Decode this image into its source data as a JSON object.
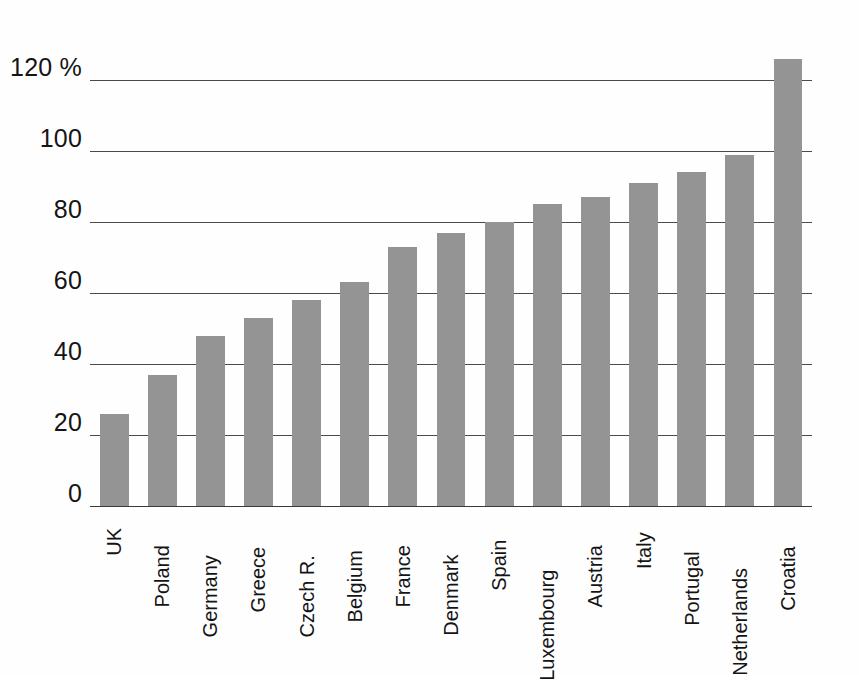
{
  "chart_data": {
    "type": "bar",
    "title": "",
    "xlabel": "",
    "ylabel": "",
    "unit_label": "%",
    "ylim": [
      0,
      135
    ],
    "yticks": [
      0,
      20,
      40,
      60,
      80,
      100,
      120
    ],
    "ytick_labels": [
      "0",
      "20",
      "40",
      "60",
      "80",
      "100",
      "120 %"
    ],
    "grid": true,
    "legend": "none",
    "bar_color": "#949494",
    "axis_color": "#4a4a4a",
    "categories": [
      "UK",
      "Poland",
      "Germany",
      "Greece",
      "Czech R.",
      "Belgium",
      "France",
      "Denmark",
      "Spain",
      "Luxembourg",
      "Austria",
      "Italy",
      "Portugal",
      "Netherlands",
      "Croatia"
    ],
    "values": [
      26,
      37,
      48,
      53,
      58,
      63,
      73,
      77,
      80,
      85,
      87,
      91,
      94,
      99,
      126
    ]
  }
}
